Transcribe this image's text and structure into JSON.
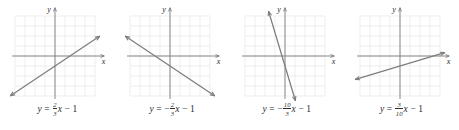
{
  "figure": {
    "background": "#ffffff",
    "panel_count": 4,
    "styles": {
      "grid_color": "#e9e6e3",
      "axis_color": "#7a7a7a",
      "line_color": "#7d7d7d",
      "text_color": "#2b2b2b"
    },
    "panels": [
      {
        "id": "panel-a",
        "axis_label_x": "x",
        "axis_label_y": "y",
        "equation": {
          "lhs": "y",
          "equals": "=",
          "sign": "",
          "numerator": "2",
          "denominator": "3",
          "variable": "x",
          "minus": "−",
          "constant": "1"
        },
        "chart_data": {
          "type": "line",
          "title": "",
          "xlabel": "x",
          "ylabel": "y",
          "grid": true,
          "xlim": [
            -4,
            4
          ],
          "ylim": [
            -4,
            4
          ],
          "slope": 0.6667,
          "intercept": -1,
          "x": [
            -4,
            4
          ],
          "y": [
            -3.667,
            1.667
          ],
          "arrows": "both"
        }
      },
      {
        "id": "panel-b",
        "axis_label_x": "x",
        "axis_label_y": "y",
        "equation": {
          "lhs": "y",
          "equals": "=",
          "sign": "−",
          "numerator": "2",
          "denominator": "3",
          "variable": "x",
          "minus": "−",
          "constant": "1"
        },
        "chart_data": {
          "type": "line",
          "title": "",
          "xlabel": "x",
          "ylabel": "y",
          "grid": true,
          "xlim": [
            -4,
            4
          ],
          "ylim": [
            -4,
            4
          ],
          "slope": -0.6667,
          "intercept": -1,
          "x": [
            -4,
            4
          ],
          "y": [
            1.667,
            -3.667
          ],
          "arrows": "both"
        }
      },
      {
        "id": "panel-c",
        "axis_label_x": "x",
        "axis_label_y": "y",
        "equation": {
          "lhs": "y",
          "equals": "=",
          "sign": "−",
          "numerator": "10",
          "denominator": "3",
          "variable": "x",
          "minus": "−",
          "constant": "1"
        },
        "chart_data": {
          "type": "line",
          "title": "",
          "xlabel": "x",
          "ylabel": "y",
          "grid": true,
          "xlim": [
            -4,
            4
          ],
          "ylim": [
            -4,
            4
          ],
          "slope": -3.3333,
          "intercept": -1,
          "x": [
            -1.2,
            0.9
          ],
          "y": [
            3.0,
            -4.0
          ],
          "arrows": "both"
        }
      },
      {
        "id": "panel-d",
        "axis_label_x": "x",
        "axis_label_y": "y",
        "equation": {
          "lhs": "y",
          "equals": "=",
          "sign": "",
          "numerator": "3",
          "denominator": "10",
          "variable": "x",
          "minus": "−",
          "constant": "1"
        },
        "chart_data": {
          "type": "line",
          "title": "",
          "xlabel": "x",
          "ylabel": "y",
          "grid": true,
          "xlim": [
            -4,
            4
          ],
          "ylim": [
            -4,
            4
          ],
          "slope": 0.3,
          "intercept": -1,
          "x": [
            -4,
            4
          ],
          "y": [
            -2.2,
            0.2
          ],
          "arrows": "both"
        }
      }
    ]
  }
}
